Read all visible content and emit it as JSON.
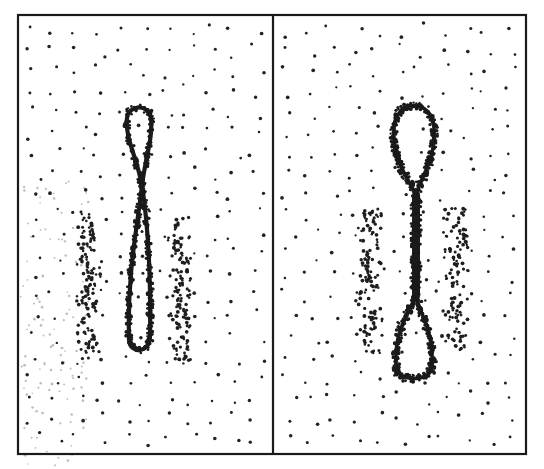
{
  "figure": {
    "width": 544,
    "height": 469,
    "background": "#ffffff",
    "ink": "#1a1a1a",
    "frame": {
      "x1": 18,
      "y1": 15,
      "x2": 526,
      "y2": 454,
      "divider_x": 273
    },
    "panels": [
      {
        "id": "left",
        "label": "",
        "bounds": {
          "x1": 18,
          "y1": 15,
          "x2": 273,
          "y2": 454
        },
        "background_dots": {
          "count": 230,
          "seed": 11,
          "radius": 1.5
        },
        "ghost_haze": {
          "x1": 20,
          "y1": 180,
          "x2": 90,
          "y2": 469,
          "count": 120,
          "seed": 71
        },
        "loop": {
          "type": "figure-eight-crossed",
          "crossing": {
            "x": 142,
            "y": 185
          },
          "upper_lobe": {
            "top_y": 108,
            "width": 28,
            "center_x": 139
          },
          "lower_lobe": {
            "bottom_y": 350,
            "width": 26,
            "center_x": 140
          },
          "stroke_width": 4.2
        },
        "clusters": [
          {
            "name": "left-flank-cluster",
            "x1": 72,
            "y1": 212,
            "x2": 104,
            "y2": 360,
            "count": 110,
            "seed": 21
          },
          {
            "name": "right-flank-cluster",
            "x1": 166,
            "y1": 218,
            "x2": 196,
            "y2": 362,
            "count": 105,
            "seed": 31
          }
        ]
      },
      {
        "id": "right",
        "label": "",
        "bounds": {
          "x1": 273,
          "y1": 15,
          "x2": 526,
          "y2": 454
        },
        "background_dots": {
          "count": 225,
          "seed": 41,
          "radius": 1.5
        },
        "loop": {
          "type": "figure-eight-twisted",
          "upper_lobe": {
            "top_y": 102,
            "bottom_y": 196,
            "width": 44,
            "center_x": 414
          },
          "neck": {
            "top_y": 196,
            "bottom_y": 296,
            "center_x": 416,
            "width": 8
          },
          "lower_lobe": {
            "top_y": 296,
            "bottom_y": 380,
            "width": 40,
            "center_x": 414
          },
          "stroke_width": 3.6
        },
        "clusters": [
          {
            "name": "left-flank-cluster",
            "x1": 352,
            "y1": 208,
            "x2": 386,
            "y2": 352,
            "count": 100,
            "seed": 51
          },
          {
            "name": "right-flank-cluster",
            "x1": 440,
            "y1": 205,
            "x2": 474,
            "y2": 350,
            "count": 100,
            "seed": 61
          }
        ]
      }
    ]
  }
}
